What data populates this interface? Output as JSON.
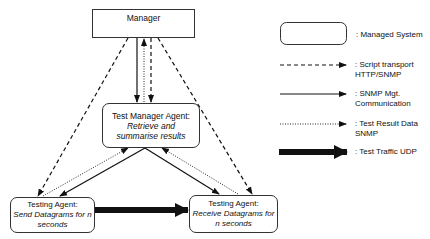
{
  "nodes": {
    "manager": {
      "label": "Manager"
    },
    "test_manager_agent": {
      "title": "Test Manager Agent:",
      "desc_line1": "Retrieve and",
      "desc_line2": "summarise results"
    },
    "sender_agent": {
      "title": "Testing Agent:",
      "desc_line1": "Send Datagrams for n",
      "desc_line2": "seconds"
    },
    "receiver_agent": {
      "title": "Testing Agent:",
      "desc_line1": "Receive Datagrams for",
      "desc_line2": "n seconds"
    }
  },
  "legend": {
    "managed_system": {
      "line1": ": Managed System"
    },
    "script_transport": {
      "line1": ": Script transport",
      "line2": "HTTP/SNMP",
      "style": "dashed"
    },
    "snmp_mgt": {
      "line1": ": SNMP Mgt.",
      "line2": "Communication",
      "style": "solid"
    },
    "test_result": {
      "line1": ": Test Result Data",
      "line2": "SNMP",
      "style": "dotted"
    },
    "test_traffic": {
      "line1": ": Test Traffic UDP",
      "style": "thick"
    }
  },
  "edges": [
    {
      "from": "manager",
      "to": "test_manager_agent",
      "type": "snmp_mgt"
    },
    {
      "from": "test_manager_agent",
      "to": "manager",
      "type": "test_result"
    },
    {
      "from": "manager",
      "to": "test_manager_agent",
      "type": "script_transport"
    },
    {
      "from": "manager",
      "to": "sender_agent",
      "type": "script_transport"
    },
    {
      "from": "manager",
      "to": "receiver_agent",
      "type": "script_transport"
    },
    {
      "from": "test_manager_agent",
      "to": "sender_agent",
      "type": "snmp_mgt"
    },
    {
      "from": "test_manager_agent",
      "to": "receiver_agent",
      "type": "snmp_mgt"
    },
    {
      "from": "sender_agent",
      "to": "test_manager_agent",
      "type": "test_result"
    },
    {
      "from": "receiver_agent",
      "to": "test_manager_agent",
      "type": "test_result"
    },
    {
      "from": "sender_agent",
      "to": "receiver_agent",
      "type": "test_traffic"
    }
  ]
}
